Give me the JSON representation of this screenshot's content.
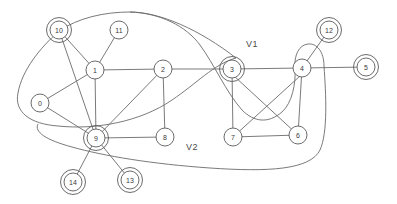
{
  "diagram": {
    "background": "#ffffff",
    "stroke_color": "#6b6b6b",
    "node_fill": "#ffffff",
    "width": 397,
    "height": 204
  },
  "nodes": [
    {
      "id": "0",
      "label": "0",
      "x": 40,
      "y": 103,
      "r": 9,
      "double": false
    },
    {
      "id": "1",
      "label": "1",
      "x": 95,
      "y": 70,
      "r": 9,
      "double": false
    },
    {
      "id": "2",
      "label": "2",
      "x": 163,
      "y": 69,
      "r": 9,
      "double": false
    },
    {
      "id": "3",
      "label": "3",
      "x": 232,
      "y": 69,
      "r": 9,
      "double": true
    },
    {
      "id": "4",
      "label": "4",
      "x": 302,
      "y": 68,
      "r": 9,
      "double": false
    },
    {
      "id": "5",
      "label": "5",
      "x": 366,
      "y": 67,
      "r": 9,
      "double": true
    },
    {
      "id": "6",
      "label": "6",
      "x": 298,
      "y": 135,
      "r": 9,
      "double": false
    },
    {
      "id": "7",
      "label": "7",
      "x": 233,
      "y": 137,
      "r": 9,
      "double": false
    },
    {
      "id": "8",
      "label": "8",
      "x": 165,
      "y": 137,
      "r": 9,
      "double": false
    },
    {
      "id": "9",
      "label": "9",
      "x": 96,
      "y": 138,
      "r": 9,
      "double": true
    },
    {
      "id": "10",
      "label": "10",
      "x": 59,
      "y": 30,
      "r": 9,
      "double": true
    },
    {
      "id": "11",
      "label": "11",
      "x": 119,
      "y": 30,
      "r": 9,
      "double": false
    },
    {
      "id": "12",
      "label": "12",
      "x": 329,
      "y": 30,
      "r": 9,
      "double": true
    },
    {
      "id": "13",
      "label": "13",
      "x": 130,
      "y": 180,
      "r": 9,
      "double": true
    },
    {
      "id": "14",
      "label": "14",
      "x": 73,
      "y": 182,
      "r": 9,
      "double": true
    }
  ],
  "edges": [
    {
      "from": "10",
      "to": "1"
    },
    {
      "from": "11",
      "to": "1"
    },
    {
      "from": "10",
      "to": "9"
    },
    {
      "from": "0",
      "to": "1"
    },
    {
      "from": "0",
      "to": "9"
    },
    {
      "from": "1",
      "to": "2"
    },
    {
      "from": "1",
      "to": "9"
    },
    {
      "from": "2",
      "to": "3"
    },
    {
      "from": "2",
      "to": "8"
    },
    {
      "from": "2",
      "to": "9"
    },
    {
      "from": "8",
      "to": "9"
    },
    {
      "from": "9",
      "to": "13"
    },
    {
      "from": "9",
      "to": "14"
    },
    {
      "from": "3",
      "to": "4"
    },
    {
      "from": "3",
      "to": "7"
    },
    {
      "from": "3",
      "to": "6"
    },
    {
      "from": "4",
      "to": "5"
    },
    {
      "from": "4",
      "to": "6"
    },
    {
      "from": "4",
      "to": "12"
    },
    {
      "from": "6",
      "to": "7"
    },
    {
      "from": "7",
      "to": "4"
    }
  ],
  "regions": [
    {
      "id": "V1",
      "label": "V1",
      "label_x": 252,
      "label_y": 44
    },
    {
      "id": "V2",
      "label": "V2",
      "label_x": 192,
      "label_y": 147
    }
  ]
}
